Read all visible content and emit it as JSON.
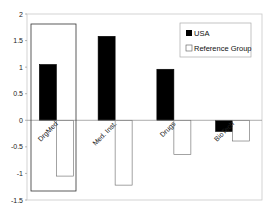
{
  "chart_data": {
    "type": "bar",
    "title": "",
    "xlabel": "",
    "ylabel": "",
    "categories": [
      "DrgMed",
      "Med. Inst.",
      "Drugs",
      "BioTech"
    ],
    "series": [
      {
        "name": "USA",
        "values": [
          1.05,
          1.58,
          0.96,
          -0.21
        ],
        "color": "#000000"
      },
      {
        "name": "Reference Group",
        "values": [
          -1.05,
          -1.22,
          -0.64,
          -0.39
        ],
        "color": "#ffffff"
      }
    ],
    "ylim": [
      -1.5,
      2
    ],
    "yticks": [
      "2",
      "1.5",
      "1",
      "0.5",
      "0",
      "-0.5",
      "-1",
      "-1.5"
    ],
    "grid": false,
    "legend_position": "top-right",
    "annotations": [
      {
        "type": "highlight-box",
        "target_category": "DrgMed"
      }
    ]
  }
}
